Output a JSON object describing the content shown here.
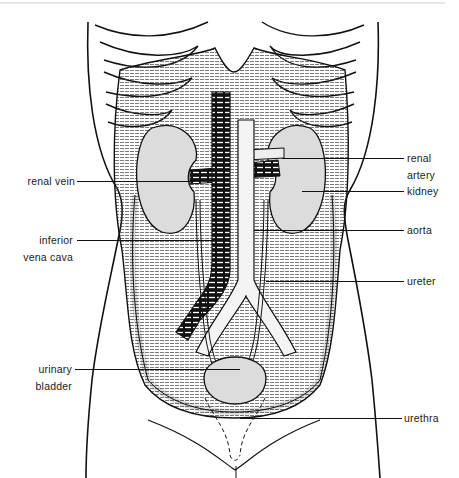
{
  "figure": {
    "colors": {
      "background": "#ffffff",
      "ink": "#111111",
      "organ_fill": "#dcdcdc",
      "vein_fill": "#1a1a1a"
    }
  },
  "labels": {
    "left": [
      {
        "id": "renal_vein",
        "lines": [
          "renal vein"
        ]
      },
      {
        "id": "inferior_vena_cava",
        "lines": [
          "inferior",
          "vena cava"
        ]
      },
      {
        "id": "urinary_bladder",
        "lines": [
          "urinary",
          "bladder"
        ]
      }
    ],
    "right": [
      {
        "id": "renal_artery",
        "lines": [
          "renal",
          "artery"
        ]
      },
      {
        "id": "kidney",
        "lines": [
          "kidney"
        ]
      },
      {
        "id": "aorta",
        "lines": [
          "aorta"
        ]
      },
      {
        "id": "ureter",
        "lines": [
          "ureter"
        ]
      },
      {
        "id": "urethra",
        "lines": [
          "urethra"
        ]
      }
    ]
  }
}
